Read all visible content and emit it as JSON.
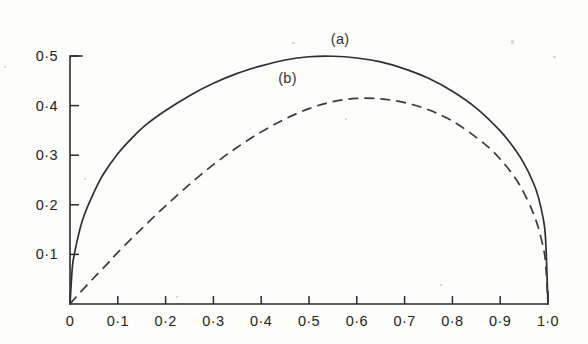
{
  "chart_data": {
    "type": "line",
    "title": "",
    "xlabel": "",
    "ylabel": "",
    "xlim": [
      0,
      1.0
    ],
    "ylim": [
      0,
      0.5
    ],
    "grid": false,
    "legend_position": "inline-annotations",
    "x_ticks": [
      0,
      0.1,
      0.2,
      0.3,
      0.4,
      0.5,
      0.6,
      0.7,
      0.8,
      0.9,
      1.0
    ],
    "x_tick_labels": [
      "0",
      "0·1",
      "0·2",
      "0·3",
      "0·4",
      "0·5",
      "0·6",
      "0·7",
      "0·8",
      "0·9",
      "1·0"
    ],
    "y_ticks": [
      0.1,
      0.2,
      0.3,
      0.4,
      0.5
    ],
    "y_tick_labels": [
      "0·1",
      "0·2",
      "0·3",
      "0·4",
      "0·5"
    ],
    "y_origin_label": "",
    "annotations": [
      {
        "text": "(a)",
        "x": 0.565,
        "y": 0.525,
        "series": "a"
      },
      {
        "text": "(b)",
        "x": 0.455,
        "y": 0.445,
        "series": "b"
      }
    ],
    "series": [
      {
        "name": "(a)",
        "style": "solid",
        "peak_x": 0.48,
        "peak_y": 0.5,
        "x": [
          0.0,
          0.005,
          0.01,
          0.02,
          0.03,
          0.05,
          0.07,
          0.1,
          0.13,
          0.16,
          0.2,
          0.25,
          0.3,
          0.35,
          0.4,
          0.45,
          0.5,
          0.55,
          0.6,
          0.65,
          0.7,
          0.75,
          0.8,
          0.85,
          0.9,
          0.93,
          0.95,
          0.97,
          0.98,
          0.99,
          0.995,
          1.0
        ],
        "y": [
          0.0,
          0.075,
          0.105,
          0.148,
          0.18,
          0.225,
          0.262,
          0.303,
          0.335,
          0.362,
          0.39,
          0.42,
          0.445,
          0.465,
          0.48,
          0.492,
          0.4985,
          0.4995,
          0.496,
          0.488,
          0.474,
          0.455,
          0.429,
          0.395,
          0.349,
          0.313,
          0.283,
          0.243,
          0.215,
          0.172,
          0.13,
          0.0
        ]
      },
      {
        "name": "(b)",
        "style": "dashed",
        "peak_x": 0.55,
        "peak_y": 0.415,
        "x": [
          0.0,
          0.02,
          0.05,
          0.08,
          0.1,
          0.15,
          0.2,
          0.25,
          0.3,
          0.35,
          0.4,
          0.45,
          0.5,
          0.55,
          0.6,
          0.65,
          0.7,
          0.75,
          0.8,
          0.85,
          0.88,
          0.9,
          0.92,
          0.94,
          0.96,
          0.97,
          0.98,
          0.99,
          0.995,
          1.0
        ],
        "y": [
          0.0,
          0.022,
          0.053,
          0.083,
          0.104,
          0.152,
          0.198,
          0.241,
          0.281,
          0.316,
          0.347,
          0.373,
          0.394,
          0.408,
          0.4145,
          0.4135,
          0.406,
          0.3915,
          0.369,
          0.336,
          0.312,
          0.292,
          0.269,
          0.241,
          0.204,
          0.181,
          0.153,
          0.114,
          0.082,
          0.0
        ]
      }
    ]
  },
  "geometry": {
    "plot_left": 70,
    "plot_right": 548,
    "plot_bottom": 304,
    "plot_top": 56,
    "y_axis_top_stub": 12
  }
}
